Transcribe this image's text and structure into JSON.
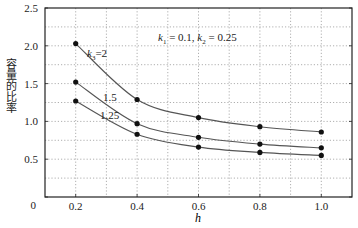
{
  "chart_data": {
    "type": "line",
    "title": "",
    "annotation": "k1 = 0.1, k2 = 0.25",
    "annotation_parts": {
      "k1_sym": "k",
      "k1_sub": "1",
      "k1_val": " = 0.1, ",
      "k2_sym": "k",
      "k2_sub": "2",
      "k2_val": " = 0.25"
    },
    "xlabel": "h",
    "ylabel": "容量的比率",
    "xlim": [
      0.1,
      1.1
    ],
    "ylim": [
      0,
      2.5
    ],
    "xticks": [
      0.2,
      0.4,
      0.6,
      0.8,
      1.0
    ],
    "xtick_labels": [
      "0.2",
      "0.4",
      "0.6",
      "0.8",
      "1.0"
    ],
    "yticks": [
      0,
      0.5,
      1.0,
      1.5,
      2.0,
      2.5
    ],
    "ytick_labels": [
      "0",
      "0.5",
      "1.0",
      "1.5",
      "2.0",
      "2.5"
    ],
    "grid": true,
    "grid_style": "dotted",
    "x_grid_minor": [
      0.3,
      0.5,
      0.7,
      0.9
    ],
    "y_grid_minor": [
      0.25,
      0.75,
      1.25,
      1.75,
      2.25
    ],
    "x": [
      0.2,
      0.4,
      0.6,
      0.8,
      1.0
    ],
    "series": [
      {
        "name": "k3=2",
        "label_prefix": "k",
        "label_sub": "3",
        "label_suffix": "=2",
        "values": [
          2.03,
          1.29,
          1.05,
          0.93,
          0.86
        ]
      },
      {
        "name": "1.5",
        "label": "1.5",
        "values": [
          1.52,
          0.97,
          0.79,
          0.7,
          0.65
        ]
      },
      {
        "name": "1.25",
        "label": "1.25",
        "values": [
          1.27,
          0.83,
          0.66,
          0.59,
          0.55
        ]
      }
    ],
    "legend": "inline labels on curves",
    "colors": {
      "line": "#555555",
      "marker": "#111111",
      "grid": "#9a9a9a",
      "axis": "#222222"
    }
  }
}
